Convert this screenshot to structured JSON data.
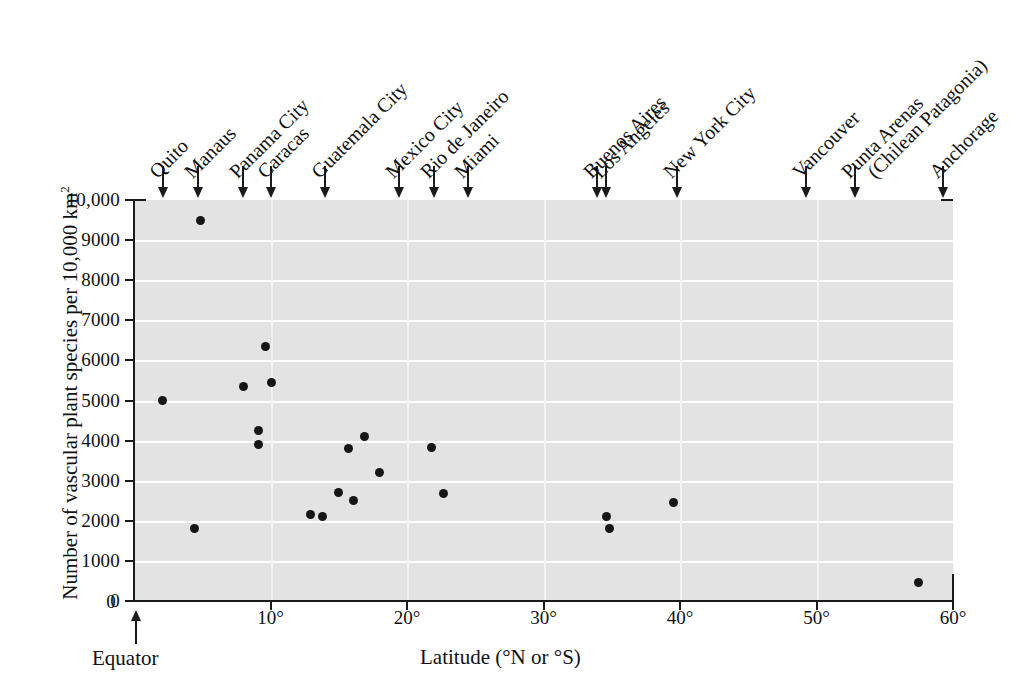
{
  "chart_data": {
    "type": "scatter",
    "title": "",
    "xlabel": "Latitude (°N or °S)",
    "ylabel": "Number of vascular plant species per 10,000 km",
    "ylabel_sup": "2",
    "xlim": [
      0,
      60
    ],
    "ylim": [
      0,
      10000
    ],
    "grid": true,
    "legend": "none",
    "xticks": [
      "0",
      "10°",
      "20°",
      "30°",
      "40°",
      "50°",
      "60°"
    ],
    "xtick_values": [
      0,
      10,
      20,
      30,
      40,
      50,
      60
    ],
    "yticks": [
      "0",
      "1000",
      "2000",
      "3000",
      "4000",
      "5000",
      "6000",
      "7000",
      "8000",
      "9000",
      "10,000"
    ],
    "ytick_values": [
      0,
      1000,
      2000,
      3000,
      4000,
      5000,
      6000,
      7000,
      8000,
      9000,
      10000
    ],
    "origin_annotation": "Equator",
    "points": [
      {
        "x": 2.1,
        "y": 5000
      },
      {
        "x": 4.9,
        "y": 9500
      },
      {
        "x": 4.4,
        "y": 1800
      },
      {
        "x": 8.0,
        "y": 5350
      },
      {
        "x": 9.1,
        "y": 4250
      },
      {
        "x": 9.1,
        "y": 3900
      },
      {
        "x": 9.6,
        "y": 6350
      },
      {
        "x": 10.1,
        "y": 5450
      },
      {
        "x": 12.9,
        "y": 2150
      },
      {
        "x": 13.8,
        "y": 2100
      },
      {
        "x": 15.0,
        "y": 2700
      },
      {
        "x": 15.7,
        "y": 3800
      },
      {
        "x": 16.1,
        "y": 2500
      },
      {
        "x": 16.9,
        "y": 4100
      },
      {
        "x": 18.0,
        "y": 3200
      },
      {
        "x": 21.8,
        "y": 3830
      },
      {
        "x": 22.7,
        "y": 2680
      },
      {
        "x": 34.6,
        "y": 2100
      },
      {
        "x": 34.8,
        "y": 1800
      },
      {
        "x": 39.5,
        "y": 2450
      },
      {
        "x": 57.5,
        "y": 450
      }
    ],
    "city_markers": [
      {
        "label": "Quito",
        "x": 2.1
      },
      {
        "label": "Manaus",
        "x": 4.7
      },
      {
        "label": "Panama City",
        "x": 8.0
      },
      {
        "label": "Caracas",
        "x": 10.0
      },
      {
        "label": "Guatemala City",
        "x": 14.0
      },
      {
        "label": "Mexico City",
        "x": 19.4
      },
      {
        "label": "Rio de Janeiro",
        "x": 22.0
      },
      {
        "label": "Miami",
        "x": 24.5
      },
      {
        "label": "Buenos Aires",
        "x": 33.9
      },
      {
        "label": "Los Angeles",
        "x": 34.6
      },
      {
        "label": "New York City",
        "x": 39.8
      },
      {
        "label": "Vancouver",
        "x": 49.2
      },
      {
        "label": "Punta Arenas",
        "x": 52.8
      },
      {
        "label": "(Chilean Patagonia)",
        "x": 52.8
      },
      {
        "label": "Anchorage",
        "x": 59.3
      }
    ],
    "colors": {
      "plot_background": "#e3e3e3",
      "gridline": "#fdfdfd",
      "axis": "#1a1a1a",
      "point": "#161616",
      "page_background": "#ffffff"
    }
  }
}
